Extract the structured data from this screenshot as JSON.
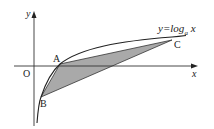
{
  "diagram": {
    "axes": {
      "x_label": "x",
      "y_label": "y",
      "origin_label": "O"
    },
    "curve": {
      "label_prefix": "y=log",
      "label_base": "a",
      "label_var": "x"
    },
    "points": {
      "A": "A",
      "B": "B",
      "C": "C"
    },
    "colors": {
      "line": "#222222",
      "shade": "#a9a9a9"
    }
  }
}
